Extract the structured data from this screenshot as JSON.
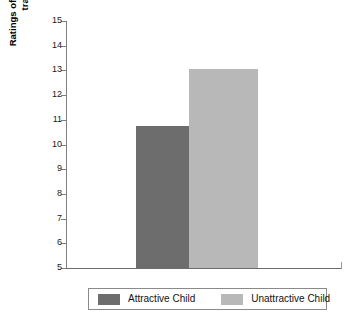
{
  "chart_data": {
    "type": "bar",
    "title": "",
    "xlabel": "",
    "ylabel": "Ratings of likelihood of future transgression",
    "ylabel_line1": "Ratings of likelihood of future",
    "ylabel_line2": "transgression",
    "categories": [
      "Attractive Child",
      "Unattractive Child"
    ],
    "values": [
      10.75,
      13.05
    ],
    "ylim": [
      5,
      15
    ],
    "ytick_step": 1,
    "yticks": [
      "15",
      "14",
      "13",
      "12",
      "11",
      "10",
      "9",
      "8",
      "7",
      "6",
      "5"
    ],
    "grid": false,
    "legend_position": "bottom",
    "series": [
      {
        "name": "Attractive Child",
        "value": 10.75,
        "color": "#6d6d6d"
      },
      {
        "name": "Unattractive Child",
        "value": 13.05,
        "color": "#b8b8b8"
      }
    ]
  },
  "legend": {
    "items": [
      {
        "label": "Attractive Child",
        "color": "#6d6d6d"
      },
      {
        "label": "Unattractive Child",
        "color": "#b8b8b8"
      }
    ]
  },
  "colors": {
    "attractive_bar": "#6d6d6d",
    "unattractive_bar": "#b8b8b8",
    "axis": "#808080",
    "legend_border": "#8a8a8a",
    "background": "#ffffff"
  }
}
